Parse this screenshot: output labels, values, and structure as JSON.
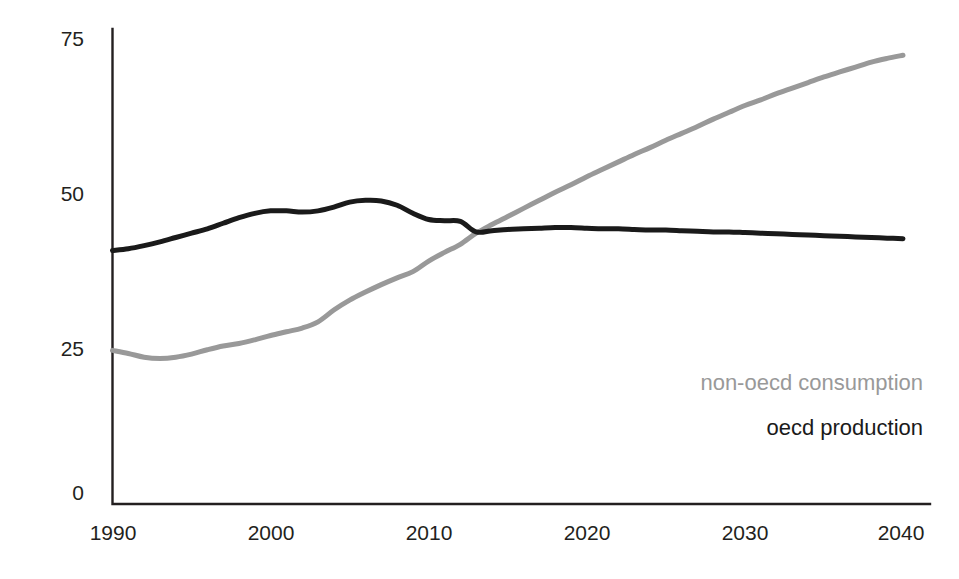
{
  "chart_data": {
    "type": "line",
    "title": "",
    "subtitle": "",
    "xlabel": "",
    "ylabel": "",
    "xlim": [
      1990,
      2040
    ],
    "ylim": [
      0,
      75
    ],
    "grid": false,
    "legend_position": "inside-bottom-right",
    "y_ticks": [
      "0",
      "25",
      "50",
      "75"
    ],
    "y_tick_values": [
      0,
      25,
      50,
      75
    ],
    "x_ticks": [
      "1990",
      "2000",
      "2010",
      "2020",
      "2030",
      "2040"
    ],
    "x_tick_values": [
      1990,
      2000,
      2010,
      2020,
      2030,
      2040
    ],
    "x": [
      1990,
      1991,
      1992,
      1993,
      1994,
      1995,
      1996,
      1997,
      1998,
      1999,
      2000,
      2001,
      2002,
      2003,
      2004,
      2005,
      2006,
      2007,
      2008,
      2009,
      2010,
      2011,
      2012,
      2013,
      2014,
      2015,
      2016,
      2017,
      2018,
      2019,
      2020,
      2021,
      2022,
      2023,
      2024,
      2025,
      2026,
      2027,
      2028,
      2029,
      2030,
      2031,
      2032,
      2033,
      2034,
      2035,
      2036,
      2037,
      2038,
      2039,
      2040
    ],
    "series": [
      {
        "name": "non-oecd consumption",
        "color": "#999999",
        "values": [
          24.7,
          24.2,
          23.6,
          23.4,
          23.6,
          24.1,
          24.8,
          25.4,
          25.8,
          26.4,
          27.1,
          27.7,
          28.3,
          29.3,
          31.2,
          32.8,
          34.1,
          35.3,
          36.4,
          37.4,
          39.1,
          40.5,
          41.8,
          43.6,
          45.0,
          46.3,
          47.6,
          48.9,
          50.2,
          51.4,
          52.7,
          53.9,
          55.1,
          56.3,
          57.4,
          58.6,
          59.7,
          60.8,
          62.0,
          63.1,
          64.2,
          65.1,
          66.1,
          67.0,
          67.9,
          68.8,
          69.6,
          70.4,
          71.2,
          71.8,
          72.3
        ]
      },
      {
        "name": "oecd production",
        "color": "#1a1a1a",
        "values": [
          40.8,
          41.1,
          41.6,
          42.2,
          42.9,
          43.6,
          44.3,
          45.2,
          46.1,
          46.8,
          47.2,
          47.2,
          47.0,
          47.2,
          47.8,
          48.6,
          48.9,
          48.8,
          48.1,
          46.8,
          45.8,
          45.6,
          45.5,
          43.8,
          44.0,
          44.2,
          44.3,
          44.4,
          44.5,
          44.5,
          44.4,
          44.3,
          44.3,
          44.2,
          44.1,
          44.1,
          44.0,
          43.9,
          43.8,
          43.8,
          43.7,
          43.6,
          43.5,
          43.4,
          43.3,
          43.2,
          43.1,
          43.0,
          42.9,
          42.8,
          42.7
        ]
      }
    ],
    "annotations": []
  },
  "legend": {
    "items": [
      {
        "label": "non-oecd consumption",
        "color": "#999999"
      },
      {
        "label": "oecd production",
        "color": "#1a1a1a"
      }
    ]
  },
  "axes": {
    "origin_label": "0"
  }
}
